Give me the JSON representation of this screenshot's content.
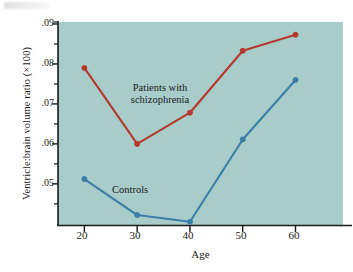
{
  "figure": {
    "background": "#ffffff",
    "panel_color": "#a8ccc9",
    "axis_color": "#1a1a1a"
  },
  "axes": {
    "y_title": "Ventricle:brain volume ratio (×100)",
    "x_title": "Age",
    "y_ticks": [
      ".05",
      ".06",
      ".07",
      ".08",
      ".09"
    ],
    "y_tick_values": [
      0.05,
      0.06,
      0.07,
      0.08,
      0.09
    ],
    "x_ticks": [
      "20",
      "30",
      "40",
      "50",
      "60"
    ],
    "x_tick_values": [
      20,
      30,
      40,
      50,
      60
    ],
    "y_minor_ticks": true,
    "grid": false
  },
  "annotations": {
    "patients_line1": "Patients with",
    "patients_line2": "schizophrenia",
    "controls": "Controls"
  },
  "chart_data": {
    "type": "line",
    "title": "",
    "xlabel": "Age",
    "ylabel": "Ventricle:brain volume ratio (×100)",
    "x": [
      20,
      30,
      40,
      50,
      60
    ],
    "xlim": [
      15,
      69
    ],
    "ylim": [
      0.0397,
      0.0905
    ],
    "grid": false,
    "legend": "inline-annotations",
    "series": [
      {
        "name": "Patients with schizophrenia",
        "color": "#b5392c",
        "marker": "circle",
        "values": [
          0.079,
          0.06,
          0.0678,
          0.0833,
          0.0873
        ]
      },
      {
        "name": "Controls",
        "color": "#3b7fa8",
        "marker": "circle",
        "values": [
          0.0512,
          0.0422,
          0.0405,
          0.0611,
          0.076
        ]
      }
    ]
  }
}
